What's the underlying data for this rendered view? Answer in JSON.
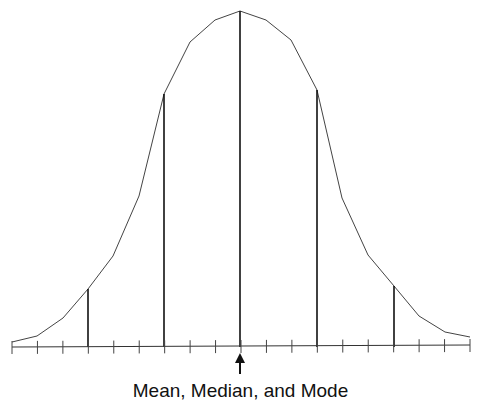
{
  "figure": {
    "caption": "Mean, Median, and Mode"
  },
  "chart_data": {
    "type": "line",
    "title": "",
    "annotation": "Mean, Median, and Mode",
    "xlabel": "",
    "ylabel": "",
    "grid": false,
    "x_ticks_count": 19,
    "curve_points_px": [
      [
        12,
        342
      ],
      [
        37,
        336
      ],
      [
        63,
        318
      ],
      [
        88,
        289
      ],
      [
        113,
        256
      ],
      [
        139,
        196
      ],
      [
        164,
        94
      ],
      [
        190,
        42
      ],
      [
        215,
        20
      ],
      [
        240,
        11
      ],
      [
        266,
        20
      ],
      [
        291,
        40
      ],
      [
        317,
        90
      ],
      [
        342,
        198
      ],
      [
        368,
        255
      ],
      [
        394,
        286
      ],
      [
        419,
        316
      ],
      [
        445,
        332
      ],
      [
        470,
        337
      ]
    ],
    "vertical_markers_px": [
      {
        "x": 88,
        "top": 289,
        "label": ""
      },
      {
        "x": 164,
        "top": 94,
        "label": ""
      },
      {
        "x": 240,
        "top": 11,
        "label": "center"
      },
      {
        "x": 317,
        "top": 90,
        "label": ""
      },
      {
        "x": 394,
        "top": 286,
        "label": ""
      }
    ],
    "axis_y_px": 347,
    "arrow_x_px": 240
  },
  "colors": {
    "curve": "#444444",
    "lines": "#111111",
    "background": "#ffffff"
  }
}
